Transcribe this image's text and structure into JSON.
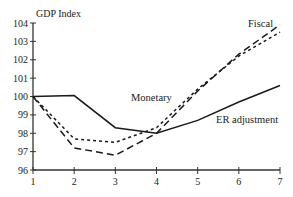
{
  "chart_data": {
    "type": "line",
    "title": "",
    "xlabel": "",
    "ylabel": "GDP Index",
    "x": [
      1,
      2,
      3,
      4,
      5,
      6,
      7
    ],
    "xlim": [
      1,
      7
    ],
    "ylim": [
      96,
      104
    ],
    "yticks": [
      96,
      97,
      98,
      99,
      100,
      101,
      102,
      103,
      104
    ],
    "xticks": [
      1,
      2,
      3,
      4,
      5,
      6,
      7
    ],
    "grid": false,
    "legend": "inline labels",
    "series": [
      {
        "name": "Monetary",
        "style": "short-dash",
        "values": [
          100,
          97.7,
          97.5,
          98.3,
          100.4,
          102.2,
          103.5
        ]
      },
      {
        "name": "Fiscal",
        "style": "long-dash",
        "values": [
          100,
          97.2,
          96.8,
          98.0,
          100.3,
          102.3,
          103.9
        ]
      },
      {
        "name": "ER adjustment",
        "style": "solid",
        "values": [
          100,
          100.05,
          98.3,
          98.0,
          98.7,
          99.7,
          100.6
        ]
      }
    ],
    "annotations": [
      {
        "text": "Fiscal",
        "x": 6.4,
        "y": 103.7
      },
      {
        "text": "Monetary",
        "x": 4.05,
        "y": 99.9
      },
      {
        "text": "ER adjustment",
        "x": 5.55,
        "y": 98.6
      }
    ]
  },
  "labels": {
    "ylabel": "GDP Index",
    "title_fragment": "",
    "fiscal": "Fiscal",
    "monetary": "Monetary",
    "er": "ER adjustment"
  },
  "colors": {
    "line": "#1a1a1a",
    "axis": "#333333"
  }
}
